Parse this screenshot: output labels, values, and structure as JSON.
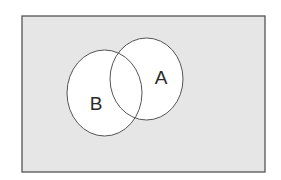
{
  "diagram": {
    "type": "venn",
    "universe": {
      "x": 22,
      "y": 16,
      "width": 243,
      "height": 156,
      "fill": "#e6e6e6",
      "stroke": "#555555"
    },
    "sets": [
      {
        "label": "B",
        "cx": 104.5,
        "cy": 93,
        "rx": 37.5,
        "ry": 43,
        "label_x": 96,
        "label_y": 110,
        "fill": "#ffffff",
        "stroke": "#555555"
      },
      {
        "label": "A",
        "cx": 146.5,
        "cy": 79,
        "rx": 36.5,
        "ry": 41,
        "label_x": 161,
        "label_y": 84,
        "fill": "#ffffff",
        "stroke": "#555555"
      }
    ]
  }
}
